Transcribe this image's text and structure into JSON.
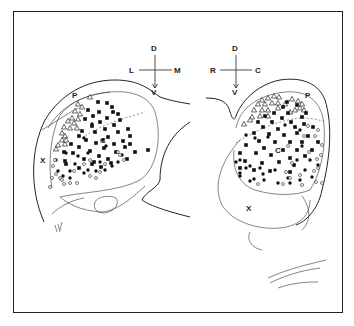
{
  "left_section": {
    "orientation": {
      "up": "D",
      "down": "V",
      "left": "L",
      "right": "M"
    },
    "region_labels": {
      "p": "P",
      "c": "C",
      "x": "X"
    },
    "triangles": [
      [
        90,
        97
      ],
      [
        78,
        104
      ],
      [
        82,
        107
      ],
      [
        75,
        111
      ],
      [
        80,
        114
      ],
      [
        72,
        118
      ],
      [
        78,
        119
      ],
      [
        68,
        121
      ],
      [
        74,
        123
      ],
      [
        64,
        127
      ],
      [
        70,
        128
      ],
      [
        62,
        133
      ],
      [
        65,
        136
      ],
      [
        77,
        128
      ],
      [
        62,
        140
      ],
      [
        58,
        145
      ],
      [
        65,
        144
      ],
      [
        56,
        149
      ],
      [
        66,
        140
      ]
    ],
    "squares": [
      [
        98,
        102
      ],
      [
        107,
        103
      ],
      [
        112,
        107
      ],
      [
        88,
        110
      ],
      [
        99,
        112
      ],
      [
        113,
        112
      ],
      [
        118,
        114
      ],
      [
        93,
        116
      ],
      [
        107,
        118
      ],
      [
        85,
        119
      ],
      [
        120,
        120
      ],
      [
        100,
        122
      ],
      [
        114,
        125
      ],
      [
        92,
        126
      ],
      [
        128,
        129
      ],
      [
        105,
        129
      ],
      [
        82,
        131
      ],
      [
        95,
        132
      ],
      [
        118,
        132
      ],
      [
        79,
        136
      ],
      [
        108,
        137
      ],
      [
        130,
        136
      ],
      [
        86,
        140
      ],
      [
        123,
        141
      ],
      [
        96,
        143
      ],
      [
        71,
        144
      ],
      [
        114,
        144
      ],
      [
        130,
        144
      ],
      [
        79,
        147
      ],
      [
        104,
        148
      ],
      [
        125,
        147
      ],
      [
        64,
        152
      ],
      [
        90,
        151
      ],
      [
        116,
        152
      ],
      [
        135,
        152
      ],
      [
        148,
        150
      ],
      [
        73,
        153
      ],
      [
        99,
        156
      ],
      [
        84,
        159
      ],
      [
        108,
        159
      ],
      [
        127,
        159
      ],
      [
        65,
        161
      ],
      [
        94,
        162
      ],
      [
        111,
        163
      ],
      [
        79,
        168
      ],
      [
        66,
        164
      ],
      [
        92,
        164
      ],
      [
        101,
        167
      ]
    ],
    "dots": [
      [
        92,
        124
      ],
      [
        84,
        138
      ],
      [
        103,
        140
      ],
      [
        66,
        153
      ],
      [
        78,
        156
      ],
      [
        100,
        162
      ],
      [
        118,
        162
      ],
      [
        70,
        171
      ],
      [
        88,
        170
      ],
      [
        112,
        166
      ],
      [
        58,
        171
      ],
      [
        84,
        173
      ],
      [
        70,
        178
      ],
      [
        75,
        164
      ],
      [
        105,
        170
      ],
      [
        88,
        153
      ],
      [
        122,
        155
      ],
      [
        63,
        176
      ],
      [
        96,
        171
      ],
      [
        106,
        146
      ],
      [
        56,
        160
      ]
    ],
    "circles": [
      [
        118,
        152
      ],
      [
        55,
        160
      ],
      [
        53,
        166
      ],
      [
        56,
        174
      ],
      [
        52,
        178
      ],
      [
        60,
        178
      ],
      [
        50,
        187
      ],
      [
        62,
        180
      ],
      [
        64,
        184
      ],
      [
        70,
        183
      ],
      [
        77,
        183
      ],
      [
        90,
        176
      ],
      [
        96,
        178
      ],
      [
        100,
        172
      ],
      [
        124,
        160
      ],
      [
        120,
        155
      ],
      [
        84,
        164
      ],
      [
        74,
        171
      ],
      [
        90,
        160
      ],
      [
        105,
        164
      ]
    ]
  },
  "right_section": {
    "orientation": {
      "up": "D",
      "down": "V",
      "left": "R",
      "right": "C"
    },
    "region_labels": {
      "p": "P",
      "c": "C",
      "x": "X"
    },
    "triangles": [
      [
        262,
        100
      ],
      [
        268,
        98
      ],
      [
        274,
        96
      ],
      [
        279,
        97
      ],
      [
        292,
        99
      ],
      [
        298,
        101
      ],
      [
        302,
        104
      ],
      [
        258,
        104
      ],
      [
        265,
        104
      ],
      [
        272,
        103
      ],
      [
        278,
        103
      ],
      [
        285,
        104
      ],
      [
        254,
        110
      ],
      [
        262,
        110
      ],
      [
        268,
        110
      ],
      [
        278,
        108
      ],
      [
        300,
        108
      ],
      [
        304,
        110
      ],
      [
        295,
        110
      ],
      [
        252,
        117
      ],
      [
        260,
        116
      ],
      [
        268,
        116
      ],
      [
        244,
        124
      ],
      [
        250,
        120
      ],
      [
        290,
        112
      ]
    ],
    "squares": [
      [
        287,
        102
      ],
      [
        283,
        107
      ],
      [
        297,
        105
      ],
      [
        274,
        113
      ],
      [
        288,
        113
      ],
      [
        306,
        113
      ],
      [
        265,
        116
      ],
      [
        282,
        118
      ],
      [
        302,
        117
      ],
      [
        258,
        122
      ],
      [
        272,
        122
      ],
      [
        291,
        122
      ],
      [
        304,
        124
      ],
      [
        263,
        127
      ],
      [
        278,
        129
      ],
      [
        295,
        127
      ],
      [
        313,
        127
      ],
      [
        254,
        133
      ],
      [
        269,
        134
      ],
      [
        284,
        135
      ],
      [
        297,
        133
      ],
      [
        308,
        136
      ],
      [
        259,
        141
      ],
      [
        275,
        142
      ],
      [
        290,
        142
      ],
      [
        302,
        142
      ],
      [
        318,
        142
      ],
      [
        246,
        145
      ],
      [
        264,
        148
      ],
      [
        283,
        150
      ],
      [
        297,
        150
      ],
      [
        312,
        150
      ],
      [
        240,
        153
      ],
      [
        256,
        153
      ],
      [
        271,
        155
      ],
      [
        290,
        158
      ],
      [
        305,
        156
      ],
      [
        245,
        161
      ],
      [
        262,
        163
      ],
      [
        279,
        162
      ],
      [
        294,
        165
      ],
      [
        240,
        168
      ],
      [
        254,
        170
      ],
      [
        270,
        171
      ],
      [
        290,
        172
      ]
    ],
    "dots": [
      [
        246,
        135
      ],
      [
        255,
        138
      ],
      [
        268,
        137
      ],
      [
        285,
        125
      ],
      [
        300,
        130
      ],
      [
        302,
        146
      ],
      [
        240,
        160
      ],
      [
        250,
        166
      ],
      [
        263,
        174
      ],
      [
        275,
        170
      ],
      [
        297,
        160
      ],
      [
        310,
        160
      ],
      [
        318,
        165
      ],
      [
        240,
        176
      ],
      [
        254,
        179
      ],
      [
        264,
        180
      ],
      [
        290,
        183
      ],
      [
        300,
        180
      ],
      [
        312,
        177
      ],
      [
        250,
        181
      ],
      [
        278,
        183
      ],
      [
        246,
        168
      ],
      [
        305,
        170
      ],
      [
        236,
        162
      ],
      [
        240,
        173
      ],
      [
        260,
        168
      ],
      [
        288,
        178
      ]
    ],
    "circles": [
      [
        308,
        126
      ],
      [
        318,
        130
      ],
      [
        304,
        136
      ],
      [
        315,
        136
      ],
      [
        322,
        145
      ],
      [
        321,
        155
      ],
      [
        288,
        146
      ],
      [
        309,
        152
      ],
      [
        317,
        159
      ],
      [
        318,
        168
      ],
      [
        286,
        172
      ],
      [
        300,
        175
      ],
      [
        258,
        184
      ],
      [
        283,
        184
      ],
      [
        290,
        178
      ],
      [
        302,
        185
      ],
      [
        316,
        182
      ],
      [
        322,
        183
      ],
      [
        314,
        171
      ],
      [
        292,
        163
      ]
    ]
  },
  "legend_symbols": [
    "open-triangle",
    "filled-square",
    "filled-circle",
    "open-circle"
  ]
}
